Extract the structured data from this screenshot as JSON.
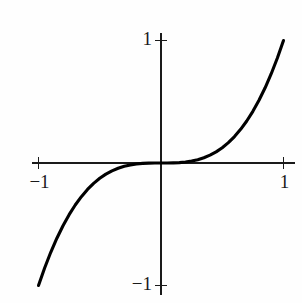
{
  "figure": {
    "background_color": "#fefefe",
    "ink_color": "#1a1a1a",
    "curve_color": "#000000"
  },
  "labels": {
    "y_top": "1",
    "y_bottom": "−1",
    "x_left": "−1",
    "x_right": "1"
  },
  "chart_data": {
    "type": "line",
    "title": "",
    "subtitle": "",
    "xlabel": "",
    "ylabel": "",
    "xlim": [
      -1.05,
      1.05
    ],
    "ylim": [
      -1.05,
      1.05
    ],
    "grid": false,
    "legend": false,
    "legend_position": "none",
    "xticks": [
      -1,
      1
    ],
    "xticklabels": [
      "−1",
      "1"
    ],
    "yticks": [
      -1,
      1
    ],
    "yticklabels": [
      "−1",
      "1"
    ],
    "axes_style": "centered-cross-spines",
    "annotations": [],
    "series": [
      {
        "name": "y = x^3",
        "equation": "y = x^3",
        "x": [
          -1.0,
          -0.95,
          -0.9,
          -0.85,
          -0.8,
          -0.75,
          -0.7,
          -0.65,
          -0.6,
          -0.55,
          -0.5,
          -0.45,
          -0.4,
          -0.35,
          -0.3,
          -0.25,
          -0.2,
          -0.15,
          -0.1,
          -0.05,
          0.0,
          0.05,
          0.1,
          0.15,
          0.2,
          0.25,
          0.3,
          0.35,
          0.4,
          0.45,
          0.5,
          0.55,
          0.6,
          0.65,
          0.7,
          0.75,
          0.8,
          0.85,
          0.9,
          0.95,
          1.0
        ],
        "y": [
          -1.0,
          -0.857,
          -0.729,
          -0.614,
          -0.512,
          -0.422,
          -0.343,
          -0.275,
          -0.216,
          -0.166,
          -0.125,
          -0.091,
          -0.064,
          -0.043,
          -0.027,
          -0.016,
          -0.008,
          -0.003,
          -0.001,
          0.0,
          0.0,
          0.0,
          0.001,
          0.003,
          0.008,
          0.016,
          0.027,
          0.043,
          0.064,
          0.091,
          0.125,
          0.166,
          0.216,
          0.275,
          0.343,
          0.422,
          0.512,
          0.614,
          0.729,
          0.857,
          1.0
        ]
      }
    ]
  },
  "geometry": {
    "origin_x": 161,
    "origin_y": 163,
    "unit_px_x": 122.5,
    "unit_px_y": 122.5,
    "x_axis_start": 32,
    "x_axis_end": 295,
    "y_axis_start": 33,
    "y_axis_end": 295,
    "tick_half_length": 6
  }
}
